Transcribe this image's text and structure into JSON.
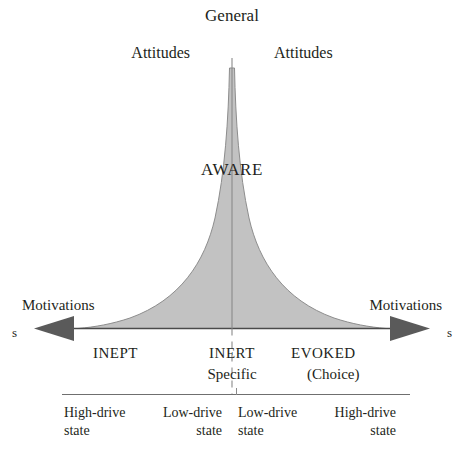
{
  "diagram": {
    "title_top": "General",
    "attitudes_left": "Attitudes",
    "attitudes_right": "Attitudes",
    "funnel_label": "AWARE",
    "motivations_left": "Motivations",
    "motivations_right": "Motivations",
    "axis_end_left": "s",
    "axis_end_right": "s",
    "sets": {
      "inept": "INEPT",
      "inert": "INERT",
      "specific": "Specific",
      "evoked": "EVOKED",
      "choice": "(Choice)"
    },
    "drive_states": [
      {
        "label": "High-drive",
        "word": "state",
        "align": "left"
      },
      {
        "label": "Low-drive",
        "word": "state",
        "align": "right"
      },
      {
        "label": "Low-drive",
        "word": "state",
        "align": "left"
      },
      {
        "label": "High-drive",
        "word": "state",
        "align": "right"
      }
    ],
    "colors": {
      "funnel_fill": "#c2c2c2",
      "funnel_edge": "#8d8d8d",
      "axis": "#4a4a4a",
      "arrow": "#5a5a5a",
      "center_line": "#8a8a8a",
      "rule": "#6f6f6f",
      "text": "#231f20",
      "background": "#ffffff"
    }
  }
}
